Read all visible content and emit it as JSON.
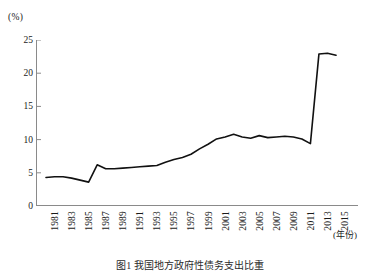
{
  "chart_data": {
    "type": "line",
    "title": "",
    "caption": "图1 我国地方政府性债务支出比重",
    "xlabel": "(年份)",
    "ylabel": "(%)",
    "y_unit_label": "(%)",
    "x_unit_label": "(年份)",
    "grid": false,
    "legend": "none",
    "xlim": [
      1981,
      2015
    ],
    "ylim": [
      0,
      25
    ],
    "y_ticks": [
      0,
      5,
      10,
      15,
      20,
      25
    ],
    "y_tick_labels": [
      "0",
      "5",
      "10",
      "15",
      "20",
      "25"
    ],
    "x_tick_labels": [
      "1981",
      "1983",
      "1985",
      "1987",
      "1989",
      "1991",
      "1993",
      "1995",
      "1997",
      "1999",
      "2001",
      "2003",
      "2005",
      "2007",
      "2009",
      "2011",
      "2013",
      "2015"
    ],
    "line_color": "#111111",
    "axis_color": "#8a8a8a",
    "x": [
      1981,
      1982,
      1983,
      1984,
      1985,
      1986,
      1987,
      1988,
      1989,
      1990,
      1991,
      1992,
      1993,
      1994,
      1995,
      1996,
      1997,
      1998,
      1999,
      2000,
      2001,
      2002,
      2003,
      2004,
      2005,
      2006,
      2007,
      2008,
      2009,
      2010,
      2011,
      2012,
      2013,
      2014,
      2015
    ],
    "values": [
      4.3,
      4.4,
      4.4,
      4.2,
      3.9,
      3.6,
      6.2,
      5.6,
      5.6,
      5.7,
      5.8,
      5.9,
      6.0,
      6.1,
      6.6,
      7.0,
      7.3,
      7.8,
      8.6,
      9.3,
      10.1,
      10.4,
      10.8,
      10.4,
      10.2,
      10.6,
      10.3,
      10.4,
      10.5,
      10.4,
      10.1,
      9.4,
      22.9,
      23.0,
      22.7
    ],
    "series": [
      {
        "name": "支出比重",
        "values": [
          4.3,
          4.4,
          4.4,
          4.2,
          3.9,
          3.6,
          6.2,
          5.6,
          5.6,
          5.7,
          5.8,
          5.9,
          6.0,
          6.1,
          6.6,
          7.0,
          7.3,
          7.8,
          8.6,
          9.3,
          10.1,
          10.4,
          10.8,
          10.4,
          10.2,
          10.6,
          10.3,
          10.4,
          10.5,
          10.4,
          10.1,
          9.4,
          22.9,
          23.0,
          22.7
        ]
      }
    ]
  }
}
